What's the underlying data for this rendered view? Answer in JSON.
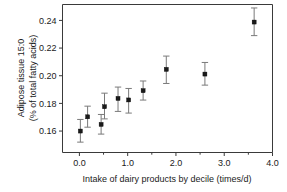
{
  "chart_data": {
    "type": "scatter",
    "title": "",
    "xlabel": "Intake of dairy products by decile (times/d)",
    "ylabel": "Adipose tissue 15:0\n(% of total fatty acids)",
    "ylabel_line1": "Adipose tissue 15:0",
    "ylabel_line2": "(% of total fatty acids)",
    "xlim": [
      -0.35,
      4.0
    ],
    "ylim": [
      0.1445,
      0.2515
    ],
    "xticks": [
      0.0,
      1.0,
      2.0,
      3.0,
      4.0
    ],
    "xticklabels": [
      "0.0",
      "1.0",
      "2.0",
      "3.0",
      "4.0"
    ],
    "xminorticks": [
      0.5,
      1.5,
      2.5,
      3.5
    ],
    "yticks": [
      0.16,
      0.18,
      0.2,
      0.22,
      0.24
    ],
    "yticklabels": [
      "0.16",
      "0.18",
      "0.20",
      "0.22",
      "0.24"
    ],
    "grid": false,
    "legend": null,
    "marker": "square",
    "errorbars": true,
    "x": [
      0.02,
      0.17,
      0.45,
      0.52,
      0.8,
      1.02,
      1.32,
      1.8,
      2.6,
      3.62
    ],
    "y": [
      0.16,
      0.1703,
      0.1648,
      0.1776,
      0.1836,
      0.1825,
      0.1892,
      0.2046,
      0.2012,
      0.2388
    ],
    "y_err_low": [
      0.152,
      0.1628,
      0.1578,
      0.1688,
      0.1742,
      0.173,
      0.1824,
      0.1944,
      0.1932,
      0.229
    ],
    "y_err_high": [
      0.1684,
      0.178,
      0.172,
      0.1874,
      0.1918,
      0.1908,
      0.1962,
      0.2142,
      0.2096,
      0.249
    ],
    "series": [
      {
        "name": "Adipose tissue 15:0",
        "points": [
          {
            "x": 0.02,
            "y": 0.16,
            "lo": 0.152,
            "hi": 0.1684
          },
          {
            "x": 0.17,
            "y": 0.1703,
            "lo": 0.1628,
            "hi": 0.178
          },
          {
            "x": 0.45,
            "y": 0.1648,
            "lo": 0.1578,
            "hi": 0.172
          },
          {
            "x": 0.52,
            "y": 0.1776,
            "lo": 0.1688,
            "hi": 0.1874
          },
          {
            "x": 0.8,
            "y": 0.1836,
            "lo": 0.1742,
            "hi": 0.1918
          },
          {
            "x": 1.02,
            "y": 0.1825,
            "lo": 0.173,
            "hi": 0.1908
          },
          {
            "x": 1.32,
            "y": 0.1892,
            "lo": 0.1824,
            "hi": 0.1962
          },
          {
            "x": 1.8,
            "y": 0.2046,
            "lo": 0.1944,
            "hi": 0.2142
          },
          {
            "x": 2.6,
            "y": 0.2012,
            "lo": 0.1932,
            "hi": 0.2096
          },
          {
            "x": 3.62,
            "y": 0.2388,
            "lo": 0.229,
            "hi": 0.249
          }
        ]
      }
    ],
    "colors": {
      "marker": "#1a1a1a",
      "errorbar": "#7a7a7a",
      "axis": "#3a3a3a",
      "text": "#1a1a1a",
      "background": "#ffffff"
    }
  }
}
